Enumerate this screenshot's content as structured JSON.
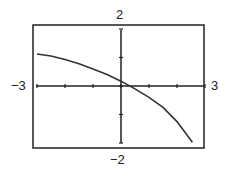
{
  "chart_data": {
    "type": "line",
    "title": "",
    "xlabel": "",
    "ylabel": "",
    "xlim": [
      -3,
      3
    ],
    "ylim": [
      -2,
      2
    ],
    "grid": false,
    "tick_labels": {
      "xmin": "−3",
      "xmax": "3",
      "ymin": "−2",
      "ymax": "2"
    },
    "series": [
      {
        "name": "f(x)",
        "x": [
          -3,
          -2.5,
          -2,
          -1.5,
          -1,
          -0.5,
          0,
          0.5,
          1,
          1.5,
          2,
          2.55
        ],
        "y": [
          1.12,
          1.05,
          0.93,
          0.78,
          0.6,
          0.4,
          0.17,
          -0.1,
          -0.4,
          -0.75,
          -1.25,
          -1.97
        ]
      }
    ]
  }
}
